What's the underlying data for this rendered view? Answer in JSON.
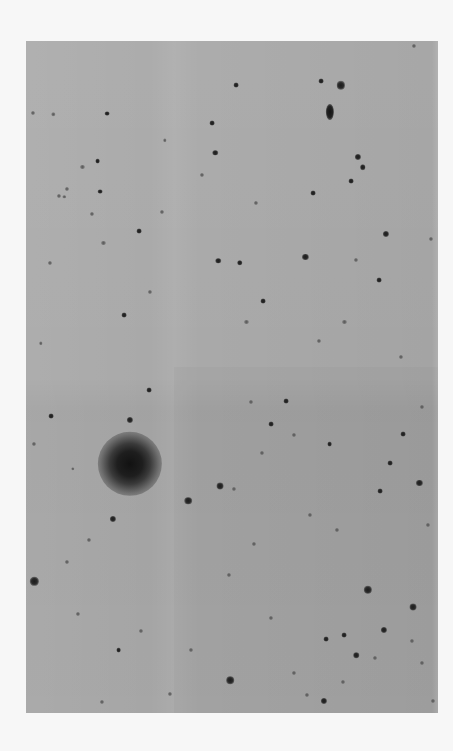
{
  "image": {
    "description": "Photographic negative sky survey plate: star field with a large diffuse galaxy",
    "colors": {
      "paper": "#f7f7f7",
      "sky_background": "#a9a9a9",
      "object": "#1c1c1c"
    }
  },
  "objects": [
    {
      "type": "elliptical",
      "name": "edge-on-galaxy",
      "x": 0.737,
      "y": 0.105,
      "rx": 0.01,
      "ry": 0.012,
      "brightness": 1.0
    },
    {
      "type": "star",
      "x": 0.764,
      "y": 0.066,
      "mag": 0.9
    },
    {
      "type": "star",
      "x": 0.716,
      "y": 0.06,
      "mag": 0.4
    },
    {
      "type": "star",
      "x": 0.806,
      "y": 0.172,
      "mag": 0.6
    },
    {
      "type": "star",
      "x": 0.941,
      "y": 0.007,
      "mag": 0.3
    },
    {
      "type": "star",
      "x": 0.452,
      "y": 0.122,
      "mag": 0.4
    },
    {
      "type": "star",
      "x": 0.509,
      "y": 0.066,
      "mag": 0.4
    },
    {
      "type": "star",
      "x": 0.428,
      "y": 0.2,
      "mag": 0.3
    },
    {
      "type": "star",
      "x": 0.459,
      "y": 0.166,
      "mag": 0.5
    },
    {
      "type": "star",
      "x": 0.137,
      "y": 0.187,
      "mag": 0.3
    },
    {
      "type": "star",
      "x": 0.174,
      "y": 0.179,
      "mag": 0.4
    },
    {
      "type": "star",
      "x": 0.18,
      "y": 0.224,
      "mag": 0.4
    },
    {
      "type": "star",
      "x": 0.08,
      "y": 0.231,
      "mag": 0.3
    },
    {
      "type": "star",
      "x": 0.1,
      "y": 0.22,
      "mag": 0.3
    },
    {
      "type": "star",
      "x": 0.017,
      "y": 0.107,
      "mag": 0.3
    },
    {
      "type": "star",
      "x": 0.197,
      "y": 0.108,
      "mag": 0.4
    },
    {
      "type": "star",
      "x": 0.066,
      "y": 0.109,
      "mag": 0.2
    },
    {
      "type": "star",
      "x": 0.33,
      "y": 0.255,
      "mag": 0.3
    },
    {
      "type": "star",
      "x": 0.337,
      "y": 0.148,
      "mag": 0.2
    },
    {
      "type": "star",
      "x": 0.558,
      "y": 0.241,
      "mag": 0.3
    },
    {
      "type": "star",
      "x": 0.696,
      "y": 0.226,
      "mag": 0.4
    },
    {
      "type": "star",
      "x": 0.789,
      "y": 0.208,
      "mag": 0.4
    },
    {
      "type": "star",
      "x": 0.817,
      "y": 0.188,
      "mag": 0.5
    },
    {
      "type": "star",
      "x": 0.873,
      "y": 0.287,
      "mag": 0.6
    },
    {
      "type": "star",
      "x": 0.983,
      "y": 0.294,
      "mag": 0.3
    },
    {
      "type": "star",
      "x": 0.8,
      "y": 0.326,
      "mag": 0.3
    },
    {
      "type": "star",
      "x": 0.858,
      "y": 0.356,
      "mag": 0.4
    },
    {
      "type": "star",
      "x": 0.519,
      "y": 0.33,
      "mag": 0.5
    },
    {
      "type": "star",
      "x": 0.467,
      "y": 0.327,
      "mag": 0.5
    },
    {
      "type": "star",
      "x": 0.678,
      "y": 0.321,
      "mag": 0.6
    },
    {
      "type": "star",
      "x": 0.575,
      "y": 0.387,
      "mag": 0.4
    },
    {
      "type": "star",
      "x": 0.535,
      "y": 0.418,
      "mag": 0.3
    },
    {
      "type": "star",
      "x": 0.71,
      "y": 0.446,
      "mag": 0.3
    },
    {
      "type": "star",
      "x": 0.773,
      "y": 0.418,
      "mag": 0.3
    },
    {
      "type": "star",
      "x": 0.093,
      "y": 0.232,
      "mag": 0.2
    },
    {
      "type": "star",
      "x": 0.16,
      "y": 0.258,
      "mag": 0.3
    },
    {
      "type": "star",
      "x": 0.274,
      "y": 0.283,
      "mag": 0.4
    },
    {
      "type": "star",
      "x": 0.188,
      "y": 0.301,
      "mag": 0.3
    },
    {
      "type": "star",
      "x": 0.059,
      "y": 0.33,
      "mag": 0.3
    },
    {
      "type": "star",
      "x": 0.301,
      "y": 0.374,
      "mag": 0.3
    },
    {
      "type": "star",
      "x": 0.238,
      "y": 0.408,
      "mag": 0.4
    },
    {
      "type": "star",
      "x": 0.298,
      "y": 0.52,
      "mag": 0.4
    },
    {
      "type": "star",
      "x": 0.061,
      "y": 0.558,
      "mag": 0.4
    },
    {
      "type": "galaxy",
      "name": "large-diffuse-galaxy",
      "x": 0.252,
      "y": 0.629,
      "r": 0.078,
      "brightness": 1.0
    },
    {
      "type": "star",
      "x": 0.252,
      "y": 0.564,
      "mag": 0.6
    },
    {
      "type": "star",
      "x": 0.393,
      "y": 0.684,
      "mag": 0.8
    },
    {
      "type": "star",
      "x": 0.471,
      "y": 0.662,
      "mag": 0.7
    },
    {
      "type": "star",
      "x": 0.211,
      "y": 0.711,
      "mag": 0.6
    },
    {
      "type": "star",
      "x": 0.152,
      "y": 0.742,
      "mag": 0.3
    },
    {
      "type": "star",
      "x": 0.02,
      "y": 0.804,
      "mag": 0.9
    },
    {
      "type": "star",
      "x": 0.099,
      "y": 0.775,
      "mag": 0.3
    },
    {
      "type": "star",
      "x": 0.595,
      "y": 0.57,
      "mag": 0.4
    },
    {
      "type": "star",
      "x": 0.651,
      "y": 0.586,
      "mag": 0.3
    },
    {
      "type": "star",
      "x": 0.737,
      "y": 0.6,
      "mag": 0.4
    },
    {
      "type": "star",
      "x": 0.884,
      "y": 0.628,
      "mag": 0.4
    },
    {
      "type": "star",
      "x": 0.915,
      "y": 0.585,
      "mag": 0.4
    },
    {
      "type": "star",
      "x": 0.955,
      "y": 0.658,
      "mag": 0.6
    },
    {
      "type": "star",
      "x": 0.859,
      "y": 0.67,
      "mag": 0.4
    },
    {
      "type": "star",
      "x": 0.631,
      "y": 0.536,
      "mag": 0.4
    },
    {
      "type": "star",
      "x": 0.547,
      "y": 0.537,
      "mag": 0.3
    },
    {
      "type": "star",
      "x": 0.572,
      "y": 0.613,
      "mag": 0.3
    },
    {
      "type": "star",
      "x": 0.504,
      "y": 0.666,
      "mag": 0.3
    },
    {
      "type": "star",
      "x": 0.553,
      "y": 0.748,
      "mag": 0.3
    },
    {
      "type": "star",
      "x": 0.493,
      "y": 0.795,
      "mag": 0.3
    },
    {
      "type": "star",
      "x": 0.83,
      "y": 0.817,
      "mag": 0.9
    },
    {
      "type": "star",
      "x": 0.94,
      "y": 0.842,
      "mag": 0.7
    },
    {
      "type": "star",
      "x": 0.868,
      "y": 0.876,
      "mag": 0.6
    },
    {
      "type": "star",
      "x": 0.728,
      "y": 0.89,
      "mag": 0.4
    },
    {
      "type": "star",
      "x": 0.773,
      "y": 0.884,
      "mag": 0.4
    },
    {
      "type": "star",
      "x": 0.801,
      "y": 0.914,
      "mag": 0.5
    },
    {
      "type": "star",
      "x": 0.847,
      "y": 0.918,
      "mag": 0.3
    },
    {
      "type": "star",
      "x": 0.495,
      "y": 0.951,
      "mag": 0.8
    },
    {
      "type": "star",
      "x": 0.28,
      "y": 0.878,
      "mag": 0.3
    },
    {
      "type": "star",
      "x": 0.225,
      "y": 0.906,
      "mag": 0.4
    },
    {
      "type": "star",
      "x": 0.125,
      "y": 0.853,
      "mag": 0.3
    },
    {
      "type": "star",
      "x": 0.4,
      "y": 0.906,
      "mag": 0.3
    },
    {
      "type": "star",
      "x": 0.65,
      "y": 0.94,
      "mag": 0.3
    },
    {
      "type": "star",
      "x": 0.724,
      "y": 0.982,
      "mag": 0.6
    },
    {
      "type": "star",
      "x": 0.595,
      "y": 0.858,
      "mag": 0.3
    },
    {
      "type": "star",
      "x": 0.681,
      "y": 0.973,
      "mag": 0.3
    },
    {
      "type": "star",
      "x": 0.185,
      "y": 0.983,
      "mag": 0.3
    },
    {
      "type": "star",
      "x": 0.35,
      "y": 0.972,
      "mag": 0.3
    },
    {
      "type": "star",
      "x": 0.77,
      "y": 0.954,
      "mag": 0.3
    },
    {
      "type": "star",
      "x": 0.96,
      "y": 0.925,
      "mag": 0.3
    },
    {
      "type": "star",
      "x": 0.937,
      "y": 0.893,
      "mag": 0.3
    },
    {
      "type": "star",
      "x": 0.988,
      "y": 0.982,
      "mag": 0.3
    },
    {
      "type": "star",
      "x": 0.975,
      "y": 0.72,
      "mag": 0.3
    },
    {
      "type": "star",
      "x": 0.91,
      "y": 0.47,
      "mag": 0.3
    },
    {
      "type": "star",
      "x": 0.96,
      "y": 0.545,
      "mag": 0.3
    },
    {
      "type": "star",
      "x": 0.02,
      "y": 0.6,
      "mag": 0.3
    },
    {
      "type": "star",
      "x": 0.113,
      "y": 0.637,
      "mag": 0.2
    },
    {
      "type": "star",
      "x": 0.036,
      "y": 0.45,
      "mag": 0.2
    },
    {
      "type": "star",
      "x": 0.69,
      "y": 0.705,
      "mag": 0.3
    },
    {
      "type": "star",
      "x": 0.755,
      "y": 0.728,
      "mag": 0.3
    }
  ]
}
